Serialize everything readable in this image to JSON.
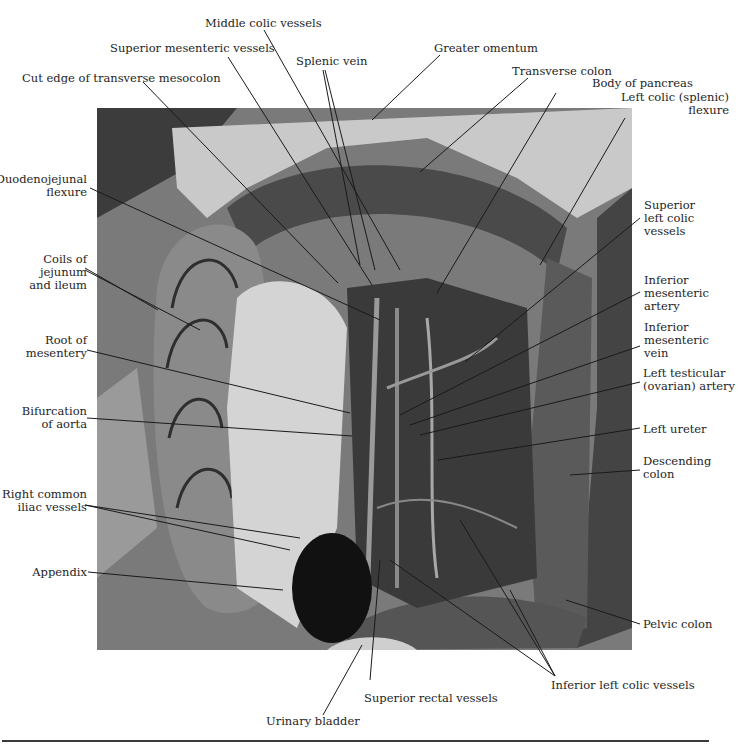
{
  "figure": {
    "labels_top": [
      {
        "id": "middle_colic",
        "text": "Middle colic vessels"
      },
      {
        "id": "sup_mes_vessels",
        "text": "Superior mesenteric vessels"
      },
      {
        "id": "splenic_vein",
        "text": "Splenic vein"
      },
      {
        "id": "greater_omentum",
        "text": "Greater omentum"
      },
      {
        "id": "cut_edge",
        "text": "Cut edge of transverse mesocolon"
      },
      {
        "id": "transverse_colon",
        "text": "Transverse colon"
      },
      {
        "id": "body_pancreas",
        "text": "Body of pancreas"
      }
    ],
    "labels_left": [
      {
        "id": "duodenojejunal",
        "lines": [
          "Duodenojejunal",
          "flexure"
        ]
      },
      {
        "id": "coils",
        "lines": [
          "Coils of",
          "jejunum",
          "and ileum"
        ]
      },
      {
        "id": "root_mesentery",
        "lines": [
          "Root of",
          "mesentery"
        ]
      },
      {
        "id": "bifurcation",
        "lines": [
          "Bifurcation",
          "of aorta"
        ]
      },
      {
        "id": "right_iliac",
        "lines": [
          "Right common",
          "iliac vessels"
        ]
      },
      {
        "id": "appendix",
        "lines": [
          "Appendix"
        ]
      }
    ],
    "labels_right": [
      {
        "id": "left_colic_flexure",
        "lines": [
          "Left colic (splenic)",
          "flexure"
        ]
      },
      {
        "id": "sup_left_colic",
        "lines": [
          "Superior",
          "left colic",
          "vessels"
        ]
      },
      {
        "id": "inf_mes_artery",
        "lines": [
          "Inferior",
          "mesenteric",
          "artery"
        ]
      },
      {
        "id": "inf_mes_vein",
        "lines": [
          "Inferior",
          "mesenteric",
          "vein"
        ]
      },
      {
        "id": "left_testicular",
        "lines": [
          "Left testicular",
          "(ovarian) artery"
        ]
      },
      {
        "id": "left_ureter",
        "lines": [
          "Left ureter"
        ]
      },
      {
        "id": "descending_colon",
        "lines": [
          "Descending",
          "colon"
        ]
      },
      {
        "id": "pelvic_colon",
        "lines": [
          "Pelvic colon"
        ]
      }
    ],
    "labels_bottom": [
      {
        "id": "inf_left_colic",
        "text": "Inferior left colic vessels"
      },
      {
        "id": "sup_rectal",
        "text": "Superior rectal vessels"
      },
      {
        "id": "urinary_bladder",
        "text": "Urinary bladder"
      }
    ]
  }
}
